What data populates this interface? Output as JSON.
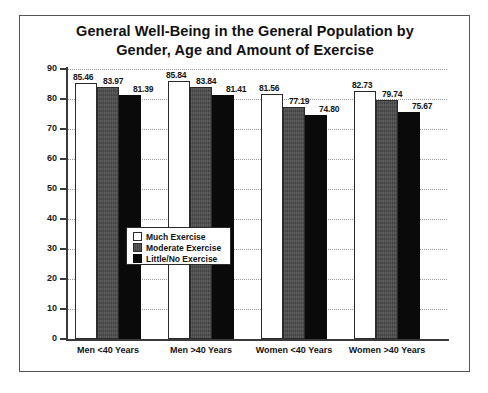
{
  "chart_data": {
    "type": "bar",
    "title": "General Well-Being in the General Population by Gender, Age and Amount of Exercise",
    "title_lines": [
      "General Well-Being in the General Population by",
      "Gender, Age and Amount of Exercise"
    ],
    "xlabel": "",
    "ylabel": "",
    "ylim": [
      0,
      90
    ],
    "ytick_step": 10,
    "yticks": [
      0,
      10,
      20,
      30,
      40,
      50,
      60,
      70,
      80,
      90
    ],
    "ytick_labels": [
      "0",
      "10",
      "20",
      "30",
      "40",
      "50",
      "60",
      "70",
      "80",
      "90"
    ],
    "grid": true,
    "grid_style": "dotted-horizontal",
    "legend_position": "center-left-inside",
    "categories": [
      "Men <40 Years",
      "Men >40 Years",
      "Women <40 Years",
      "Women >40 Years"
    ],
    "series": [
      {
        "name": "Much Exercise",
        "color": "#ffffff",
        "values": [
          85.46,
          85.84,
          81.56,
          82.73
        ],
        "labels": [
          "85.46",
          "85.84",
          "81.56",
          "82.73"
        ]
      },
      {
        "name": "Moderate Exercise",
        "color": "#4a4a4a",
        "values": [
          83.97,
          83.84,
          77.19,
          79.74
        ],
        "labels": [
          "83.97",
          "83.84",
          "77.19",
          "79.74"
        ]
      },
      {
        "name": "Little/No Exercise",
        "color": "#0a0a0a",
        "values": [
          81.39,
          81.41,
          74.8,
          75.67
        ],
        "labels": [
          "81.39",
          "81.41",
          "74.80",
          "75.67"
        ]
      }
    ]
  },
  "legend": {
    "items": [
      {
        "label": "Much Exercise",
        "swatch": "much"
      },
      {
        "label": "Moderate Exercise",
        "swatch": "moderate"
      },
      {
        "label": "Little/No Exercise",
        "swatch": "little"
      }
    ]
  }
}
